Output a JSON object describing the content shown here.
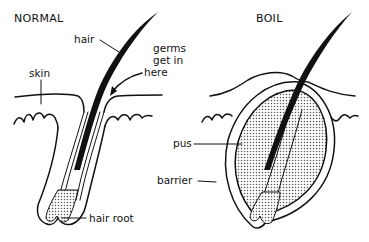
{
  "panels": {
    "normal": {
      "title": "NORMAL",
      "labels": {
        "hair": "hair",
        "germs_line1": "germs",
        "germs_line2": "get in",
        "germs_line3": "here",
        "skin": "skin",
        "hair_root": "hair root"
      }
    },
    "boil": {
      "title": "BOIL",
      "labels": {
        "pus": "pus",
        "barrier": "barrier"
      }
    }
  },
  "colors": {
    "ink": "#111111",
    "background": "#ffffff",
    "pus_fill": "#bdbdbd"
  }
}
